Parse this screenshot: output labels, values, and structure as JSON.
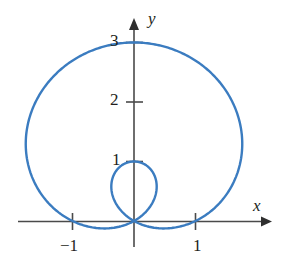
{
  "figure": {
    "name": "polar-curve-limacon-plot",
    "background_color": "#ffffff",
    "curve_color": "#3b7cc0",
    "axis_color": "#4a4a4a",
    "text_color": "#231f20"
  },
  "axes": {
    "x_axis_label": "x",
    "y_axis_label": "y",
    "origin_px": {
      "x": 134,
      "y": 221
    },
    "unit_px": {
      "x": 61.5,
      "y": 59.5
    },
    "x_ticks": [
      {
        "value": -1,
        "label": "−1"
      },
      {
        "value": 1,
        "label": "1"
      }
    ],
    "y_ticks": [
      {
        "value": 1,
        "label": "1"
      },
      {
        "value": 2,
        "label": "2"
      },
      {
        "value": 3,
        "label": "3"
      }
    ]
  },
  "chart_data": {
    "type": "line",
    "title": "",
    "xlabel": "x",
    "ylabel": "y",
    "grid": false,
    "legend": null,
    "coordinate_system": "polar",
    "equation": "r = 1 + 2 sin(θ)",
    "xlim": [
      -2.0,
      2.2
    ],
    "ylim": [
      -0.35,
      3.15
    ],
    "x_tick_values": [
      -1,
      1
    ],
    "y_tick_values": [
      1,
      2,
      3
    ],
    "series": [
      {
        "name": "outer loop",
        "theta_range_deg": [
          -30,
          210
        ],
        "r_formula": "1 + 2*sin(theta)",
        "key_points": [
          {
            "x": 0.0,
            "y": 0.0,
            "note": "origin, theta = -30°"
          },
          {
            "x": 1.0,
            "y": 0.0,
            "note": "x-intercept at x = 1"
          },
          {
            "x": 1.8,
            "y": 1.1,
            "note": "rightmost extent"
          },
          {
            "x": 0.0,
            "y": 3.0,
            "note": "top, maximum y = 3"
          },
          {
            "x": -1.8,
            "y": 1.1,
            "note": "leftmost extent"
          },
          {
            "x": -1.0,
            "y": 0.0,
            "note": "x-intercept at x = -1"
          },
          {
            "x": 0.0,
            "y": 0.0,
            "note": "origin, theta = 210°"
          }
        ]
      },
      {
        "name": "inner loop",
        "theta_range_deg": [
          210,
          330
        ],
        "r_formula": "1 + 2*sin(theta)",
        "key_points": [
          {
            "x": 0.0,
            "y": 0.0,
            "note": "origin, theta = 210°"
          },
          {
            "x": -0.37,
            "y": 0.44,
            "note": "left bulge"
          },
          {
            "x": 0.0,
            "y": 1.0,
            "note": "top of inner loop, y = 1"
          },
          {
            "x": 0.37,
            "y": 0.44,
            "note": "right bulge"
          },
          {
            "x": 0.0,
            "y": 0.0,
            "note": "origin, theta = 330°"
          }
        ]
      }
    ]
  }
}
